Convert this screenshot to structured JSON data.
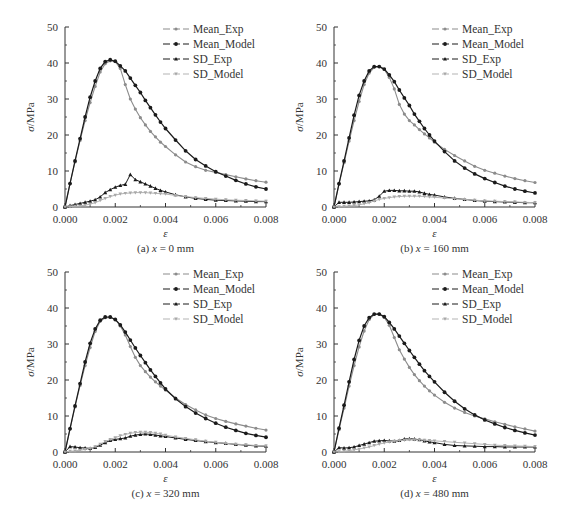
{
  "figure": {
    "panels": [
      "(a) x = 0 mm",
      "(b) x = 160 mm",
      "(c) x = 320 mm",
      "(d) x = 480 mm"
    ]
  },
  "legend": [
    "Mean_Exp",
    "Mean_Model",
    "SD_Exp",
    "SD_Model"
  ],
  "colors": {
    "Mean_Exp": "#8a8a8a",
    "Mean_Model": "#1a1a1a",
    "SD_Exp": "#1a1a1a",
    "SD_Model": "#b0b0b0"
  },
  "axes": {
    "xlabel": "ε",
    "ylabel": "σ/MPa",
    "xticks": [
      "0.000",
      "0.002",
      "0.004",
      "0.006",
      "0.008"
    ],
    "yticks": [
      "0",
      "10",
      "20",
      "30",
      "40",
      "50"
    ]
  },
  "chart_data": [
    {
      "type": "line",
      "title": "(a) x = 0 mm",
      "xlabel": "ε",
      "ylabel": "σ/MPa",
      "xlim": [
        0,
        0.008
      ],
      "ylim": [
        0,
        50
      ],
      "grid": false,
      "legend_position": "upper right",
      "x": [
        0,
        0.0002,
        0.0004,
        0.0006,
        0.0008,
        0.001,
        0.0012,
        0.0014,
        0.0016,
        0.0018,
        0.002,
        0.0022,
        0.0024,
        0.0026,
        0.0028,
        0.003,
        0.0032,
        0.0034,
        0.0036,
        0.0038,
        0.004,
        0.0044,
        0.0048,
        0.0052,
        0.0056,
        0.006,
        0.0064,
        0.0068,
        0.0072,
        0.0076,
        0.008
      ],
      "series": [
        {
          "name": "Mean_Exp",
          "values": [
            0,
            6.5,
            12.5,
            18.5,
            24,
            29,
            33.5,
            37.5,
            39.8,
            40.6,
            40.4,
            38.5,
            34,
            30,
            27.2,
            24.8,
            22.8,
            21,
            19.5,
            18,
            16.8,
            14.5,
            12.5,
            11.2,
            10.2,
            9.6,
            9,
            8.4,
            7.8,
            7.3,
            6.9
          ]
        },
        {
          "name": "Mean_Model",
          "values": [
            0,
            6.5,
            12.8,
            19,
            25,
            30.5,
            35,
            38.5,
            40.4,
            40.9,
            40.5,
            39.2,
            37.8,
            35.8,
            33.8,
            31.8,
            29.6,
            27.6,
            25.6,
            23.6,
            21.8,
            18.6,
            15.6,
            13.2,
            11.4,
            9.8,
            8.6,
            7.4,
            6.4,
            5.6,
            5.0
          ]
        },
        {
          "name": "SD_Exp",
          "values": [
            0,
            0.4,
            0.7,
            1.0,
            1.3,
            1.6,
            2.0,
            2.8,
            4.0,
            4.8,
            5.5,
            6.0,
            6.3,
            9.0,
            7.6,
            7.0,
            6.4,
            5.8,
            5.2,
            4.6,
            4.2,
            3.4,
            2.8,
            2.4,
            2.1,
            1.9,
            1.8,
            1.7,
            1.6,
            1.5,
            1.5
          ]
        },
        {
          "name": "SD_Model",
          "values": [
            0,
            0.1,
            0.2,
            0.3,
            0.5,
            0.8,
            1.2,
            1.8,
            2.4,
            2.9,
            3.3,
            3.6,
            3.8,
            3.9,
            4.0,
            4.0,
            4.0,
            3.9,
            3.8,
            3.7,
            3.6,
            3.2,
            2.9,
            2.6,
            2.4,
            2.2,
            2.0,
            1.9,
            1.8,
            1.7,
            1.6
          ]
        }
      ]
    },
    {
      "type": "line",
      "title": "(b) x = 160 mm",
      "xlabel": "ε",
      "ylabel": "σ/MPa",
      "xlim": [
        0,
        0.008
      ],
      "ylim": [
        0,
        50
      ],
      "grid": false,
      "legend_position": "upper right",
      "x": [
        0,
        0.0002,
        0.0004,
        0.0006,
        0.0008,
        0.001,
        0.0012,
        0.0014,
        0.0016,
        0.0018,
        0.002,
        0.0022,
        0.0024,
        0.0026,
        0.0028,
        0.003,
        0.0032,
        0.0034,
        0.0036,
        0.0038,
        0.004,
        0.0044,
        0.0048,
        0.0052,
        0.0056,
        0.006,
        0.0064,
        0.0068,
        0.0072,
        0.0076,
        0.008
      ],
      "series": [
        {
          "name": "Mean_Exp",
          "values": [
            0,
            6.3,
            12.3,
            18.3,
            24,
            29.3,
            34,
            37.2,
            38.8,
            39,
            38.2,
            36,
            32.8,
            28.5,
            25.8,
            24,
            22.8,
            21.5,
            20.3,
            19.2,
            18,
            16,
            14.3,
            12.8,
            11.3,
            10.2,
            9.4,
            8.6,
            7.9,
            7.3,
            6.8
          ]
        },
        {
          "name": "Mean_Model",
          "values": [
            0,
            6.5,
            12.8,
            19.2,
            25.5,
            31,
            35,
            37.8,
            39,
            39,
            38.3,
            36.7,
            34.8,
            32.5,
            30.3,
            28.2,
            25.8,
            23.8,
            21.8,
            20,
            18.3,
            15.4,
            12.8,
            10.8,
            9.2,
            7.9,
            6.8,
            5.8,
            5.0,
            4.4,
            3.9
          ]
        },
        {
          "name": "SD_Exp",
          "values": [
            0,
            1.3,
            1.3,
            1.3,
            1.4,
            1.5,
            1.6,
            1.7,
            2.0,
            3.0,
            4.4,
            4.6,
            4.6,
            4.5,
            4.5,
            4.4,
            4.4,
            4.2,
            3.8,
            3.5,
            3.3,
            2.8,
            2.4,
            2.1,
            1.8,
            1.6,
            1.5,
            1.4,
            1.3,
            1.2,
            1.2
          ]
        },
        {
          "name": "SD_Model",
          "values": [
            0,
            0.1,
            0.2,
            0.3,
            0.4,
            0.6,
            0.9,
            1.2,
            1.7,
            2.1,
            2.4,
            2.6,
            2.8,
            2.9,
            3.0,
            3.0,
            3.0,
            3.0,
            2.9,
            2.8,
            2.7,
            2.5,
            2.3,
            2.1,
            1.9,
            1.7,
            1.6,
            1.5,
            1.4,
            1.3,
            1.2
          ]
        }
      ]
    },
    {
      "type": "line",
      "title": "(c) x = 320 mm",
      "xlabel": "ε",
      "ylabel": "σ/MPa",
      "xlim": [
        0,
        0.008
      ],
      "ylim": [
        0,
        50
      ],
      "grid": false,
      "legend_position": "upper right",
      "x": [
        0,
        0.0002,
        0.0004,
        0.0006,
        0.0008,
        0.001,
        0.0012,
        0.0014,
        0.0016,
        0.0018,
        0.002,
        0.0022,
        0.0024,
        0.0026,
        0.0028,
        0.003,
        0.0032,
        0.0034,
        0.0036,
        0.0038,
        0.004,
        0.0044,
        0.0048,
        0.0052,
        0.0056,
        0.006,
        0.0064,
        0.0068,
        0.0072,
        0.0076,
        0.008
      ],
      "series": [
        {
          "name": "Mean_Exp",
          "values": [
            0,
            6.3,
            12.5,
            18.5,
            24,
            29,
            33.5,
            36.3,
            37.3,
            37.4,
            36.8,
            35,
            32.5,
            29.3,
            26.3,
            24,
            22.3,
            20.8,
            19.5,
            18.3,
            17.2,
            15,
            13.2,
            11.7,
            10.3,
            9.3,
            8.5,
            7.8,
            7.2,
            6.6,
            6.1
          ]
        },
        {
          "name": "Mean_Model",
          "values": [
            0,
            6.5,
            12.8,
            19,
            25,
            30.2,
            34.2,
            36.6,
            37.5,
            37.5,
            36.8,
            35.3,
            33.3,
            31.1,
            28.9,
            26.8,
            24.8,
            22.8,
            21,
            19.2,
            17.5,
            14.8,
            12.6,
            10.8,
            9.3,
            8.0,
            6.9,
            6.0,
            5.2,
            4.6,
            4.1
          ]
        },
        {
          "name": "SD_Exp",
          "values": [
            0,
            1.5,
            1.4,
            1.2,
            1.1,
            1.0,
            1.3,
            1.9,
            2.6,
            3.2,
            3.5,
            3.7,
            3.9,
            4.4,
            4.7,
            4.9,
            5.0,
            4.9,
            4.7,
            4.5,
            4.3,
            3.9,
            3.5,
            3.2,
            2.9,
            2.6,
            2.4,
            2.1,
            1.9,
            1.7,
            1.6
          ]
        },
        {
          "name": "SD_Model",
          "values": [
            0,
            0.2,
            0.3,
            0.5,
            0.7,
            1.0,
            1.5,
            2.2,
            2.9,
            3.5,
            4.0,
            4.5,
            4.9,
            5.2,
            5.4,
            5.5,
            5.5,
            5.4,
            5.2,
            5.0,
            4.7,
            4.2,
            3.8,
            3.4,
            3.0,
            2.7,
            2.4,
            2.2,
            2.0,
            1.8,
            1.7
          ]
        }
      ]
    },
    {
      "type": "line",
      "title": "(d) x = 480 mm",
      "xlabel": "ε",
      "ylabel": "σ/MPa",
      "xlim": [
        0,
        0.008
      ],
      "ylim": [
        0,
        50
      ],
      "grid": false,
      "legend_position": "upper right",
      "x": [
        0,
        0.0002,
        0.0004,
        0.0006,
        0.0008,
        0.001,
        0.0012,
        0.0014,
        0.0016,
        0.0018,
        0.002,
        0.0022,
        0.0024,
        0.0026,
        0.0028,
        0.003,
        0.0032,
        0.0034,
        0.0036,
        0.0038,
        0.004,
        0.0044,
        0.0048,
        0.0052,
        0.0056,
        0.006,
        0.0064,
        0.0068,
        0.0072,
        0.0076,
        0.008
      ],
      "series": [
        {
          "name": "Mean_Exp",
          "values": [
            0,
            6.2,
            12.2,
            18.3,
            24,
            29.2,
            33.6,
            36.8,
            38.2,
            38.3,
            37.4,
            35.2,
            31.8,
            28.4,
            25.8,
            23.5,
            21.5,
            19.8,
            18.3,
            17,
            15.8,
            13.8,
            12.2,
            11,
            10,
            9.2,
            8.4,
            7.7,
            7.0,
            6.4,
            5.8
          ]
        },
        {
          "name": "Mean_Model",
          "values": [
            0,
            6.6,
            13,
            19.5,
            25.7,
            31,
            35,
            37.3,
            38.3,
            38.3,
            37.6,
            36,
            34.2,
            32.2,
            30.2,
            28.2,
            26.3,
            24.4,
            22.6,
            21,
            19.5,
            16.6,
            14.1,
            12,
            10.3,
            8.9,
            7.8,
            6.8,
            6.0,
            5.3,
            4.7
          ]
        },
        {
          "name": "SD_Exp",
          "values": [
            0,
            1.2,
            1.1,
            1.2,
            1.4,
            1.8,
            2.2,
            2.6,
            3.0,
            3.1,
            3.2,
            3.1,
            3.0,
            3.2,
            3.6,
            3.7,
            3.6,
            3.4,
            3.1,
            2.8,
            2.6,
            2.1,
            1.8,
            1.7,
            1.6,
            1.5,
            1.5,
            1.4,
            1.4,
            1.4,
            1.4
          ]
        },
        {
          "name": "SD_Model",
          "values": [
            0,
            0.1,
            0.2,
            0.4,
            0.6,
            0.8,
            1.1,
            1.4,
            1.8,
            2.2,
            2.5,
            2.8,
            3.0,
            3.2,
            3.3,
            3.4,
            3.4,
            3.4,
            3.3,
            3.2,
            3.1,
            2.9,
            2.7,
            2.5,
            2.3,
            2.1,
            1.9,
            1.8,
            1.7,
            1.6,
            1.5
          ]
        }
      ]
    }
  ]
}
